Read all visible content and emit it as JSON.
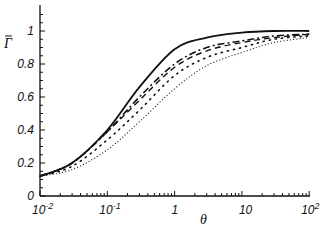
{
  "chart_data": {
    "type": "line",
    "title": "",
    "xlabel": "θ",
    "ylabel": "Γ̄",
    "xscale": "log",
    "xlim": [
      0.01,
      100
    ],
    "ylim": [
      0,
      1.15
    ],
    "grid": false,
    "legend": null,
    "x_ticks": [
      "10^-2",
      "10^-1",
      "1",
      "10",
      "10^2"
    ],
    "y_ticks": [
      "0",
      "0.2",
      "0.4",
      "0.6",
      "0.8",
      "1"
    ],
    "x": [
      0.01,
      0.03,
      0.1,
      0.3,
      1,
      3,
      10,
      30,
      100
    ],
    "series": [
      {
        "name": "solid",
        "style": "solid",
        "values": [
          0.12,
          0.2,
          0.4,
          0.66,
          0.89,
          0.96,
          0.99,
          1.0,
          1.0
        ]
      },
      {
        "name": "dash-dot",
        "style": "dashdot",
        "values": [
          0.12,
          0.2,
          0.39,
          0.6,
          0.8,
          0.9,
          0.94,
          0.97,
          0.98
        ]
      },
      {
        "name": "dashed",
        "style": "dashed",
        "values": [
          0.12,
          0.2,
          0.39,
          0.58,
          0.78,
          0.88,
          0.93,
          0.96,
          0.98
        ]
      },
      {
        "name": "sparse-dotted",
        "style": "sparse-dots",
        "values": [
          0.12,
          0.18,
          0.34,
          0.52,
          0.73,
          0.84,
          0.9,
          0.95,
          0.97
        ]
      },
      {
        "name": "dotted",
        "style": "dotted",
        "values": [
          0.12,
          0.16,
          0.28,
          0.45,
          0.65,
          0.79,
          0.87,
          0.93,
          0.96
        ]
      }
    ]
  },
  "axes": {
    "x_tick_labels": [
      {
        "base": "10",
        "exp": "-2"
      },
      {
        "base": "10",
        "exp": "-1"
      },
      {
        "base": "1",
        "exp": ""
      },
      {
        "base": "10",
        "exp": ""
      },
      {
        "base": "10",
        "exp": "2"
      }
    ],
    "y_tick_labels": [
      "0",
      "0.2",
      "0.4",
      "0.6",
      "0.8",
      "1"
    ],
    "x_title": "θ",
    "y_title": "Γ̄"
  }
}
